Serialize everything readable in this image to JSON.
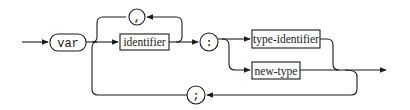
{
  "diagram": {
    "type": "syntax-diagram",
    "nodes": {
      "var_keyword": {
        "label": "var",
        "shape": "rounded-terminal"
      },
      "comma": {
        "label": ",",
        "shape": "circle-terminal"
      },
      "identifier": {
        "label": "identifier",
        "shape": "rectangle-nonterminal"
      },
      "colon": {
        "label": ":",
        "shape": "circle-terminal"
      },
      "type_identifier": {
        "label": "type-identifier",
        "shape": "rectangle-nonterminal"
      },
      "new_type": {
        "label": "new-type",
        "shape": "rectangle-nonterminal"
      },
      "semicolon": {
        "label": ";",
        "shape": "circle-terminal"
      }
    },
    "edges": [
      {
        "from": "entry",
        "to": "var"
      },
      {
        "from": "var",
        "to": "identifier"
      },
      {
        "from": "identifier",
        "to": "comma",
        "note": "loop back"
      },
      {
        "from": "comma",
        "to": "identifier"
      },
      {
        "from": "identifier",
        "to": ":"
      },
      {
        "from": ":",
        "to": "type-identifier"
      },
      {
        "from": ":",
        "to": "new-type"
      },
      {
        "from": "type-identifier",
        "to": "exit"
      },
      {
        "from": "new-type",
        "to": "exit"
      },
      {
        "from": "type-identifier/new-type",
        "to": ";"
      },
      {
        "from": ";",
        "to": "identifier",
        "note": "return to after var"
      }
    ],
    "colors": {
      "stroke": "#1a1a1a",
      "background": "#ffffff"
    }
  }
}
